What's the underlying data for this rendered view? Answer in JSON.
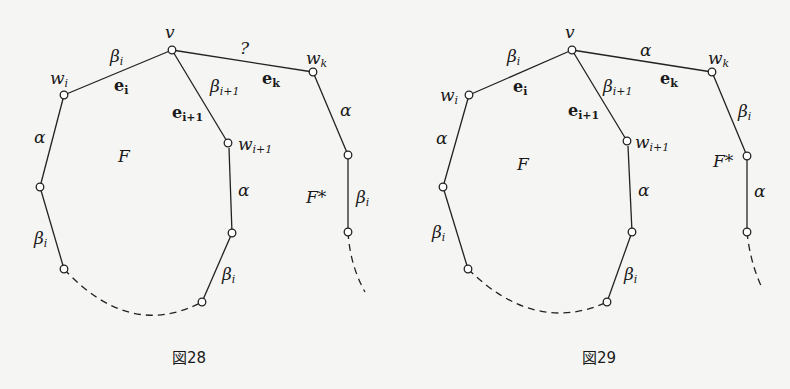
{
  "figures": [
    {
      "caption": "図28",
      "vertex_v": "v",
      "vertex_wi": {
        "base": "w",
        "sub": "i"
      },
      "vertex_wk": {
        "base": "w",
        "sub": "k"
      },
      "vertex_wi1": {
        "base": "w",
        "sub": "i+1"
      },
      "face_f": "F",
      "face_fstar": "F*",
      "edge_vwi_color": {
        "base": "β",
        "sub": "i"
      },
      "edge_vwi_name": {
        "base": "e",
        "sub": "i"
      },
      "edge_vwi1_color": {
        "base": "β",
        "sub": "i+1"
      },
      "edge_vwi1_name": {
        "base": "e",
        "sub": "i+1"
      },
      "edge_vwk_color": "?",
      "edge_vwk_name": {
        "base": "e",
        "sub": "k"
      },
      "edge_left_upper": "α",
      "edge_left_lower": {
        "base": "β",
        "sub": "i"
      },
      "edge_mid_upper": "α",
      "edge_mid_lower": {
        "base": "β",
        "sub": "i"
      },
      "edge_right_upper": "α",
      "edge_right_lower": {
        "base": "β",
        "sub": "i"
      }
    },
    {
      "caption": "図29",
      "vertex_v": "v",
      "vertex_wi": {
        "base": "w",
        "sub": "i"
      },
      "vertex_wk": {
        "base": "w",
        "sub": "k"
      },
      "vertex_wi1": {
        "base": "w",
        "sub": "i+1"
      },
      "face_f": "F",
      "face_fstar": "F*",
      "edge_vwi_color": {
        "base": "β",
        "sub": "i"
      },
      "edge_vwi_name": {
        "base": "e",
        "sub": "i"
      },
      "edge_vwi1_color": {
        "base": "β",
        "sub": "i+1"
      },
      "edge_vwi1_name": {
        "base": "e",
        "sub": "i+1"
      },
      "edge_vwk_color": "α",
      "edge_vwk_name": {
        "base": "e",
        "sub": "k"
      },
      "edge_left_upper": "α",
      "edge_left_lower": {
        "base": "β",
        "sub": "i"
      },
      "edge_mid_upper": "α",
      "edge_mid_lower": {
        "base": "β",
        "sub": "i"
      },
      "edge_right_upper": {
        "base": "β",
        "sub": "i"
      },
      "edge_right_lower": "α"
    }
  ]
}
